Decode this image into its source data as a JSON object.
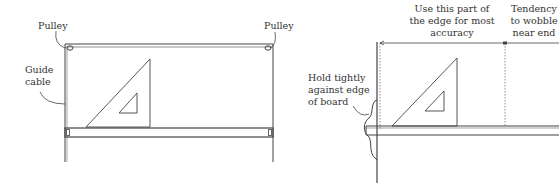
{
  "left_figure": {
    "labels": {
      "pulley_left": "Pulley",
      "pulley_right": "Pulley",
      "guide_cable_line1": "Guide",
      "guide_cable_line2": "cable"
    }
  },
  "right_figure": {
    "labels": {
      "accuracy_line1": "Use this part of",
      "accuracy_line2": "the edge for most",
      "accuracy_line3": "accuracy",
      "wobble_line1": "Tendency",
      "wobble_line2": "to wobble",
      "wobble_line3": "near end",
      "hold_line1": "Hold tightly",
      "hold_line2": "against edge",
      "hold_line3": "of board"
    }
  },
  "colors": {
    "line": "#444444",
    "text": "#333333",
    "background": "#ffffff"
  }
}
